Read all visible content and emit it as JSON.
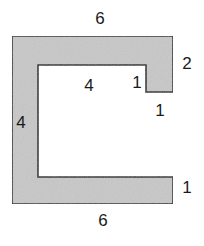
{
  "diagram": {
    "shape": "C-shaped polygon with notch",
    "fill_color": "#c8c8c8",
    "stroke_color": "#2a2a2a",
    "labels": {
      "top": "6",
      "right_top": "2",
      "notch_inner_vertical": "1",
      "notch_bottom": "1",
      "inner_top": "4",
      "inner_left": "4",
      "right_bottom": "1",
      "bottom": "6"
    }
  }
}
